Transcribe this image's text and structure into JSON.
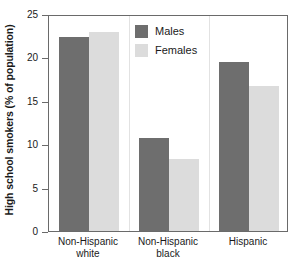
{
  "chart_data": {
    "type": "bar",
    "title": "",
    "xlabel": "",
    "ylabel": "High school smokers (% of population)",
    "categories": [
      "Non-Hispanic white",
      "Non-Hispanic black",
      "Hispanic"
    ],
    "category_lines": [
      [
        "Non-Hispanic",
        "white"
      ],
      [
        "Non-Hispanic",
        "black"
      ],
      [
        "Hispanic",
        ""
      ]
    ],
    "series": [
      {
        "name": "Males",
        "color": "#6e6e6e",
        "values": [
          22.3,
          10.7,
          19.5
        ]
      },
      {
        "name": "Females",
        "color": "#dcdcdc",
        "values": [
          22.9,
          8.3,
          16.7
        ]
      }
    ],
    "ylim": [
      0,
      25
    ],
    "yticks": [
      0,
      5,
      10,
      15,
      20,
      25
    ],
    "ytick_labels": [
      "0",
      "5",
      "10",
      "15",
      "20",
      "25"
    ],
    "grid": false,
    "legend_position": "top-center",
    "group_separators": true
  },
  "legend": {
    "items": [
      {
        "label": "Males",
        "swatch": "males"
      },
      {
        "label": "Females",
        "swatch": "females"
      }
    ]
  },
  "axis": {
    "y_title": "High school smokers (% of population)"
  }
}
